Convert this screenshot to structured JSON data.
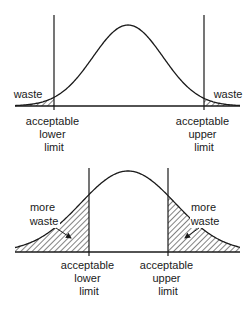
{
  "colors": {
    "stroke": "#1a1a1a",
    "background": "#ffffff"
  },
  "panels": [
    {
      "id": "top",
      "waste_labels": {
        "left": {
          "lines": [
            "waste"
          ]
        },
        "right": {
          "lines": [
            "waste"
          ]
        }
      },
      "limit_labels": {
        "lower": {
          "lines": [
            "acceptable",
            "lower",
            "limit"
          ]
        },
        "upper": {
          "lines": [
            "acceptable",
            "upper",
            "limit"
          ]
        }
      }
    },
    {
      "id": "bottom",
      "waste_labels": {
        "left": {
          "lines": [
            "more",
            "waste"
          ]
        },
        "right": {
          "lines": [
            "more",
            "waste"
          ]
        }
      },
      "limit_labels": {
        "lower": {
          "lines": [
            "acceptable",
            "lower",
            "limit"
          ]
        },
        "upper": {
          "lines": [
            "acceptable",
            "upper",
            "limit"
          ]
        }
      }
    }
  ],
  "chart_data": [
    {
      "type": "area",
      "title": "",
      "description": "Normal distribution with narrow spread; small shaded waste tails beyond acceptable limits",
      "curve": {
        "center_x": 128,
        "baseline_y": 106,
        "peak_y": 25,
        "sigma_px": 35,
        "x_start": 15,
        "x_end": 240
      },
      "limits": {
        "lower_x": 54,
        "upper_x": 204,
        "line_top_y": 15
      },
      "shaded_regions": [
        "left tail below lower limit",
        "right tail above upper limit"
      ],
      "annotations": [
        "waste",
        "waste",
        "acceptable lower limit",
        "acceptable upper limit"
      ]
    },
    {
      "type": "area",
      "title": "",
      "description": "Normal distribution with wider spread; larger shaded waste regions beyond acceptable limits",
      "curve": {
        "center_x": 128,
        "baseline_y": 252,
        "peak_y": 171,
        "sigma_px": 47,
        "x_start": 15,
        "x_end": 240
      },
      "limits": {
        "lower_x": 89,
        "upper_x": 168,
        "line_top_y": 168
      },
      "shaded_regions": [
        "left tail below lower limit",
        "right tail above upper limit"
      ],
      "annotations": [
        "more waste",
        "more waste",
        "acceptable lower limit",
        "acceptable upper limit"
      ]
    }
  ]
}
